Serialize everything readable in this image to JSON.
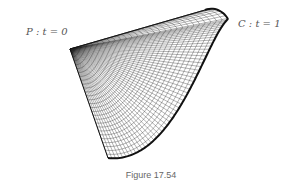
{
  "figure": {
    "caption": "Figure 17.54",
    "labels": {
      "start": "P : t = 0",
      "end": "C : t = 1"
    },
    "colors": {
      "mesh": "#222222",
      "curve": "#111111",
      "label": "#555555",
      "caption": "#666666"
    }
  }
}
